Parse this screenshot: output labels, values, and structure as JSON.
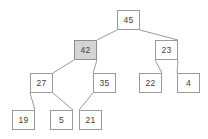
{
  "diagram": {
    "type": "binary tree",
    "background_color": "#ffffff",
    "node_border_color": "#9a9a9a",
    "node_fill_color": "#ffffff",
    "node_highlight_fill_color": "#d4d4d4",
    "edge_color": "#9a9a9a",
    "text_color": "#3d3d3d",
    "width": 208,
    "height": 139,
    "nodes": [
      {
        "id": "n45",
        "label": "45",
        "x": 117,
        "y": 10,
        "highlight": false
      },
      {
        "id": "n42",
        "label": "42",
        "x": 74,
        "y": 40,
        "highlight": true
      },
      {
        "id": "n23",
        "label": "23",
        "x": 155,
        "y": 40,
        "highlight": false
      },
      {
        "id": "n27",
        "label": "27",
        "x": 30,
        "y": 73,
        "highlight": false
      },
      {
        "id": "n35",
        "label": "35",
        "x": 93,
        "y": 73,
        "highlight": false
      },
      {
        "id": "n22",
        "label": "22",
        "x": 139,
        "y": 73,
        "highlight": false
      },
      {
        "id": "n4",
        "label": "4",
        "x": 177,
        "y": 73,
        "highlight": false
      },
      {
        "id": "n19",
        "label": "19",
        "x": 12,
        "y": 110,
        "highlight": false
      },
      {
        "id": "n5",
        "label": "5",
        "x": 50,
        "y": 110,
        "highlight": false
      },
      {
        "id": "n21",
        "label": "21",
        "x": 79,
        "y": 110,
        "highlight": false
      }
    ],
    "edges": [
      {
        "id": "e45-42",
        "from": "n45",
        "to": "n42",
        "x1": 117,
        "y1": 30,
        "x2": 97,
        "y2": 40
      },
      {
        "id": "e45-23",
        "from": "n45",
        "to": "n23",
        "x1": 140,
        "y1": 30,
        "x2": 178,
        "y2": 40
      },
      {
        "id": "e42-27",
        "from": "n42",
        "to": "n27",
        "x1": 74,
        "y1": 60,
        "x2": 53,
        "y2": 73
      },
      {
        "id": "e42-35",
        "from": "n42",
        "to": "n35",
        "x1": 97,
        "y1": 60,
        "x2": 93,
        "y2": 73
      },
      {
        "id": "e23-22",
        "from": "n23",
        "to": "n22",
        "x1": 155,
        "y1": 60,
        "x2": 162,
        "y2": 73
      },
      {
        "id": "e23-4",
        "from": "n23",
        "to": "n4",
        "x1": 178,
        "y1": 60,
        "x2": 177,
        "y2": 73
      },
      {
        "id": "e27-19",
        "from": "n27",
        "to": "n19",
        "x1": 30,
        "y1": 93,
        "x2": 35,
        "y2": 110
      },
      {
        "id": "e27-5",
        "from": "n27",
        "to": "n5",
        "x1": 53,
        "y1": 93,
        "x2": 73,
        "y2": 110
      },
      {
        "id": "e35-21",
        "from": "n35",
        "to": "n21",
        "x1": 93,
        "y1": 93,
        "x2": 79,
        "y2": 110
      }
    ]
  }
}
